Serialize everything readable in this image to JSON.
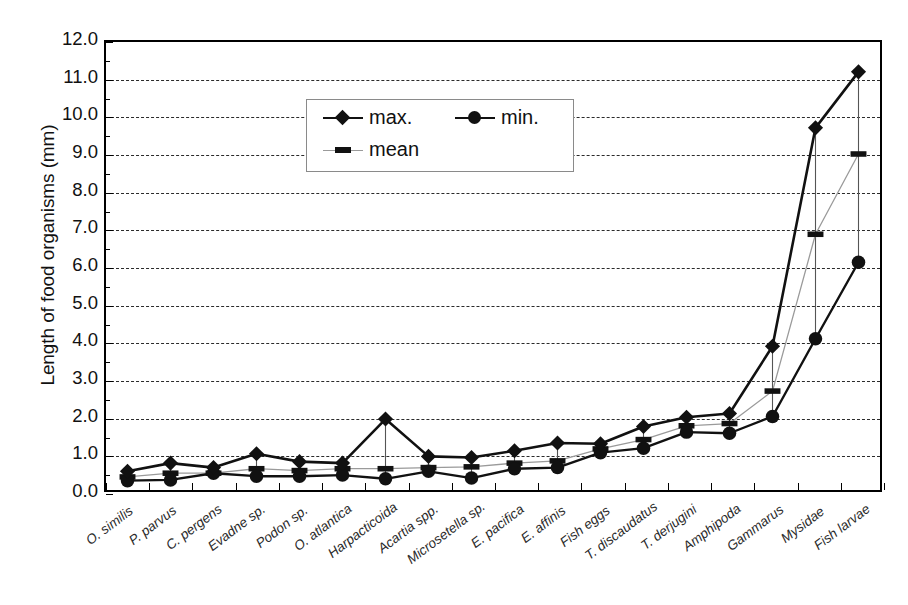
{
  "chart": {
    "type": "line",
    "ylabel": "Length of food organisms (mm)",
    "xlabel": ""
  },
  "legend": {
    "position": "top-left-inside",
    "items": [
      {
        "key": "max",
        "label": "max.",
        "marker": "diamond-marker"
      },
      {
        "key": "min",
        "label": "min.",
        "marker": "circle-marker"
      },
      {
        "key": "mean",
        "label": "mean",
        "marker": "dash-marker"
      }
    ]
  },
  "yaxis": {
    "min": 0.0,
    "max": 12.0,
    "step": 1.0,
    "ticks": [
      "0.0",
      "1.0",
      "2.0",
      "3.0",
      "4.0",
      "5.0",
      "6.0",
      "7.0",
      "8.0",
      "9.0",
      "10.0",
      "11.0",
      "12.0"
    ]
  },
  "colors": {
    "max_line": "#111111",
    "min_line": "#111111",
    "mean_line": "#9a9a9a",
    "grid": "#2b2b2b",
    "frame": "#000000",
    "background": "#ffffff"
  },
  "chart_data": {
    "type": "line",
    "title": "",
    "xlabel": "",
    "ylabel": "Length of food organisms (mm)",
    "ylim": [
      0.0,
      12.0
    ],
    "grid": true,
    "legend_position": "upper left",
    "categories": [
      "O. similis",
      "P. parvus",
      "C. pergens",
      "Evadne sp.",
      "Podon sp.",
      "O. atlantica",
      "Harpacticoida",
      "Acartia spp.",
      "Microsetella sp.",
      "E. pacifica",
      "E. affinis",
      "Fish eggs",
      "T. discaudatus",
      "T. derjugini",
      "Amphipoda",
      "Gammarus",
      "Mysidae",
      "Fish larvae"
    ],
    "series": [
      {
        "name": "max.",
        "values": [
          0.5,
          0.72,
          0.6,
          0.97,
          0.76,
          0.72,
          1.9,
          0.9,
          0.87,
          1.05,
          1.26,
          1.24,
          1.7,
          1.95,
          2.05,
          3.85,
          9.7,
          11.2
        ]
      },
      {
        "name": "mean",
        "values": [
          0.35,
          0.45,
          0.45,
          0.57,
          0.52,
          0.57,
          0.57,
          0.6,
          0.62,
          0.72,
          0.78,
          1.1,
          1.35,
          1.72,
          1.78,
          2.65,
          6.85,
          9.0
        ]
      },
      {
        "name": "min.",
        "values": [
          0.25,
          0.27,
          0.45,
          0.37,
          0.37,
          0.4,
          0.3,
          0.5,
          0.32,
          0.57,
          0.6,
          1.0,
          1.12,
          1.55,
          1.52,
          1.97,
          4.05,
          6.1
        ]
      }
    ]
  }
}
